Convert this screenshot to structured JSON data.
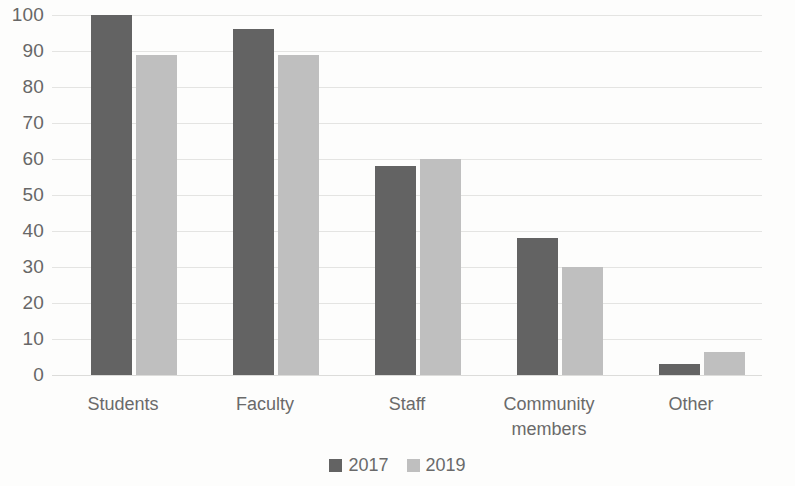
{
  "chart_data": {
    "type": "bar",
    "title": "",
    "subtitle": "",
    "xlabel": "",
    "ylabel": "",
    "categories": [
      "Students",
      "Faculty",
      "Staff",
      "Community members",
      "Other"
    ],
    "series": [
      {
        "name": "2017",
        "color": "#636363",
        "values": [
          100,
          96,
          58,
          38,
          3
        ]
      },
      {
        "name": "2019",
        "color": "#bfbfbf",
        "values": [
          89,
          89,
          60,
          30,
          6.5
        ]
      }
    ],
    "ylim": [
      0,
      100
    ],
    "y_ticks": [
      0,
      10,
      20,
      30,
      40,
      50,
      60,
      70,
      80,
      90,
      100
    ],
    "grid": true,
    "legend_position": "bottom",
    "annotations": []
  },
  "axis": {
    "tick_labels": [
      "100",
      "90",
      "80",
      "70",
      "60",
      "50",
      "40",
      "30",
      "20",
      "10",
      "0"
    ]
  },
  "categories": [
    {
      "line1": "Students",
      "line2": ""
    },
    {
      "line1": "Faculty",
      "line2": ""
    },
    {
      "line1": "Staff",
      "line2": ""
    },
    {
      "line1": "Community",
      "line2": "members"
    },
    {
      "line1": "Other",
      "line2": ""
    }
  ],
  "legend": {
    "items": [
      {
        "label": "2017",
        "color": "#636363"
      },
      {
        "label": "2019",
        "color": "#bfbfbf"
      }
    ]
  }
}
